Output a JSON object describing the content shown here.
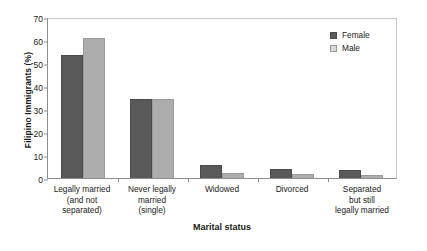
{
  "chart_data": {
    "type": "bar",
    "title": "",
    "xlabel": "Marital status",
    "ylabel": "Filipino Immigrants (%)",
    "ylim": [
      0,
      70
    ],
    "yticks": [
      0,
      10,
      20,
      30,
      40,
      50,
      60,
      70
    ],
    "grid": false,
    "legend_position": "top-right",
    "categories": [
      "Legally married\n(and not\nseparated)",
      "Never legally\nmarried\n(single)",
      "Widowed",
      "Divorced",
      "Separated\nbut still\nlegally married"
    ],
    "category_lines": [
      [
        "Legally married",
        "(and not",
        "separated)"
      ],
      [
        "Never legally",
        "married",
        "(single)"
      ],
      [
        "Widowed"
      ],
      [
        "Divorced"
      ],
      [
        "Separated",
        "but still",
        "legally married"
      ]
    ],
    "series": [
      {
        "name": "Female",
        "color": "#595959",
        "values": [
          53.5,
          34.2,
          5.7,
          4.0,
          3.5
        ]
      },
      {
        "name": "Male",
        "color": "#adadad",
        "values": [
          61.0,
          34.2,
          2.0,
          1.7,
          1.5
        ]
      }
    ]
  },
  "legend": {
    "items": [
      {
        "label": "Female",
        "swatch": "dark-gray-square"
      },
      {
        "label": "Male",
        "swatch": "light-gray-square"
      }
    ]
  },
  "axes": {
    "y_title": "Filipino Immigrants (%)",
    "x_title": "Marital status",
    "y_tick_labels": [
      "0",
      "10",
      "20",
      "30",
      "40",
      "50",
      "60",
      "70"
    ]
  }
}
